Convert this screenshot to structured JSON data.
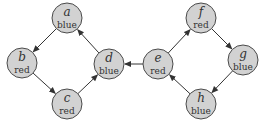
{
  "diagram": {
    "type": "directed-graph",
    "nodes": [
      {
        "id": "a",
        "name": "a",
        "color_label": "blue",
        "x": 67,
        "y": 18
      },
      {
        "id": "b",
        "name": "b",
        "color_label": "red",
        "x": 22,
        "y": 63
      },
      {
        "id": "c",
        "name": "c",
        "color_label": "red",
        "x": 67,
        "y": 104
      },
      {
        "id": "d",
        "name": "d",
        "color_label": "blue",
        "x": 109,
        "y": 64
      },
      {
        "id": "e",
        "name": "e",
        "color_label": "red",
        "x": 158,
        "y": 64
      },
      {
        "id": "f",
        "name": "f",
        "color_label": "red",
        "x": 201,
        "y": 18
      },
      {
        "id": "g",
        "name": "g",
        "color_label": "blue",
        "x": 243,
        "y": 60
      },
      {
        "id": "h",
        "name": "h",
        "color_label": "blue",
        "x": 201,
        "y": 104
      }
    ],
    "edges": [
      {
        "from": "a",
        "to": "b"
      },
      {
        "from": "b",
        "to": "c"
      },
      {
        "from": "c",
        "to": "d"
      },
      {
        "from": "d",
        "to": "a"
      },
      {
        "from": "e",
        "to": "d"
      },
      {
        "from": "e",
        "to": "f"
      },
      {
        "from": "f",
        "to": "g"
      },
      {
        "from": "g",
        "to": "h"
      },
      {
        "from": "h",
        "to": "e"
      }
    ],
    "style": {
      "node_fill": "#d2d2d2",
      "node_stroke": "#4a4a4a",
      "edge_color": "#333333",
      "node_radius": 15
    }
  }
}
